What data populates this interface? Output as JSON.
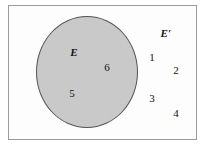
{
  "figure": {
    "type": "venn-diagram",
    "width": 207,
    "height": 151,
    "background_color": "#ffffff"
  },
  "universe": {
    "name": "universal-set-rectangle",
    "fill_color": "#fdfdfd",
    "border_color": "#9a9a9a"
  },
  "sets": {
    "e": {
      "label": "E",
      "fill_color": "#c9c9c9",
      "border_color": "#555555"
    },
    "e_complement": {
      "label": "E′"
    }
  },
  "elements": {
    "inside_e": [
      {
        "value": "6"
      },
      {
        "value": "5"
      }
    ],
    "outside_e": [
      {
        "value": "1"
      },
      {
        "value": "2"
      },
      {
        "value": "3"
      },
      {
        "value": "4"
      }
    ]
  },
  "chart_data": {
    "type": "venn",
    "title": "",
    "universe_elements": [
      "1",
      "2",
      "3",
      "4",
      "5",
      "6"
    ],
    "sets": [
      {
        "name": "E",
        "label": "E",
        "members": [
          "5",
          "6"
        ],
        "fill": "#c9c9c9"
      },
      {
        "name": "E-complement",
        "label": "E′",
        "members": [
          "1",
          "2",
          "3",
          "4"
        ],
        "fill": "#fdfdfd"
      }
    ]
  }
}
